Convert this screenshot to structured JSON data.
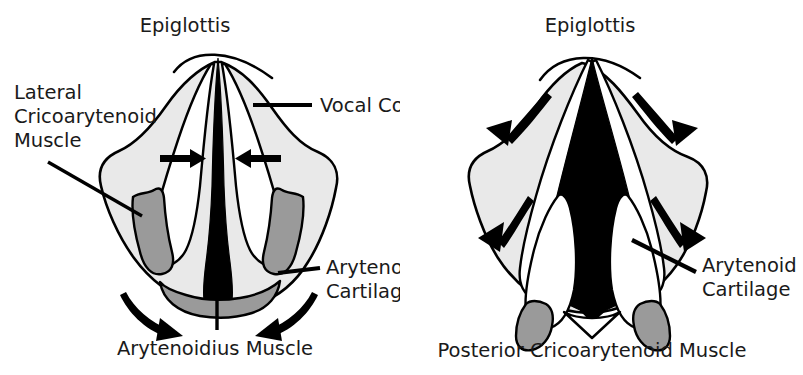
{
  "figure": {
    "colors": {
      "outline": "#000000",
      "body_fill": "#e9e9e9",
      "muscle_fill": "#9a9a9a",
      "cartilage_fill": "#ffffff",
      "glottis_fill": "#000000",
      "text": "#1a1a1a",
      "background": "#ffffff"
    }
  },
  "panels": [
    {
      "id": "closed-glottis",
      "state": "adducted",
      "labels": {
        "epiglottis": "Epiglottis",
        "lateral_cricoarytenoid_line1": "Lateral",
        "lateral_cricoarytenoid_line2": "Cricoarytenoid",
        "lateral_cricoarytenoid_line3": "Muscle",
        "vocal_cord": "Vocal Cord",
        "arytenoid_cartilage_line1": "Arytenoid",
        "arytenoid_cartilage_line2": "Cartilage",
        "arytenoidius_muscle": "Arytenoidius Muscle"
      },
      "arrows": [
        {
          "name": "adduction-arrow-left",
          "direction": "right",
          "type": "straight"
        },
        {
          "name": "adduction-arrow-right",
          "direction": "left",
          "type": "straight"
        },
        {
          "name": "arytenoidius-arrow-left",
          "direction": "down-right",
          "type": "curved"
        },
        {
          "name": "arytenoidius-arrow-right",
          "direction": "down-left",
          "type": "curved"
        }
      ]
    },
    {
      "id": "open-glottis",
      "state": "abducted",
      "labels": {
        "epiglottis": "Epiglottis",
        "arytenoid_cartilage_line1": "Arytenoid",
        "arytenoid_cartilage_line2": "Cartilage",
        "posterior_cricoarytenoid_muscle": "Posterior Cricoarytenoid Muscle"
      },
      "arrows": [
        {
          "name": "abduction-arrow-upper-left",
          "direction": "up-left",
          "type": "curved"
        },
        {
          "name": "abduction-arrow-upper-right",
          "direction": "up-right",
          "type": "curved"
        },
        {
          "name": "abduction-arrow-lower-left",
          "direction": "down-left",
          "type": "curved"
        },
        {
          "name": "abduction-arrow-lower-right",
          "direction": "down-right",
          "type": "curved"
        }
      ]
    }
  ]
}
